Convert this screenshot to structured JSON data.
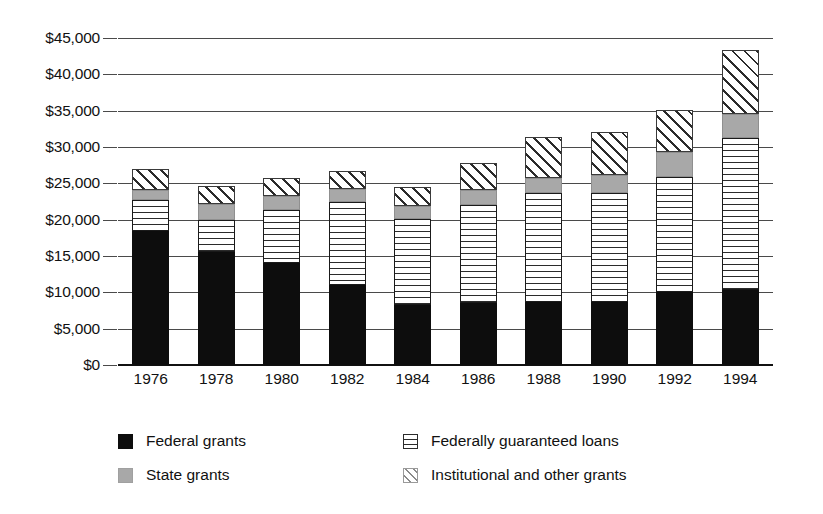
{
  "chart_data": {
    "type": "bar",
    "stacked": true,
    "title": "",
    "subtitle": "",
    "xlabel": "",
    "ylabel": "",
    "grid": true,
    "legend_position": "bottom",
    "ylim": [
      0,
      45000
    ],
    "ytick_step": 5000,
    "ytick_labels": [
      "$0",
      "$5,000",
      "$10,000",
      "$15,000",
      "$20,000",
      "$25,000",
      "$30,000",
      "$35,000",
      "$40,000",
      "$45,000"
    ],
    "ytick_values": [
      0,
      5000,
      10000,
      15000,
      20000,
      25000,
      30000,
      35000,
      40000,
      45000
    ],
    "categories": [
      "1976",
      "1978",
      "1980",
      "1982",
      "1984",
      "1986",
      "1988",
      "1990",
      "1992",
      "1994"
    ],
    "series": [
      {
        "name": "Federal grants",
        "pattern": "solid-black",
        "color": "#0d0d0d",
        "values": [
          18400,
          15500,
          14000,
          11000,
          8300,
          8500,
          8700,
          8700,
          10100,
          10300
        ]
      },
      {
        "name": "Federally guaranteed loans",
        "pattern": "horizontal-lines",
        "color": "#2b2b2b",
        "values": [
          4300,
          4400,
          7300,
          11400,
          11800,
          13500,
          15000,
          15000,
          15800,
          21000
        ]
      },
      {
        "name": "State grants",
        "pattern": "solid-gray",
        "color": "#a8a8a8",
        "values": [
          1400,
          2300,
          1900,
          1800,
          1800,
          2100,
          2100,
          2500,
          3400,
          3300
        ]
      },
      {
        "name": "Institutional and other grants",
        "pattern": "diagonal-hatch",
        "color": "#3a3a3a",
        "values": [
          2900,
          2500,
          2500,
          2500,
          2600,
          3700,
          5600,
          5800,
          5800,
          8700
        ]
      }
    ],
    "totals": [
      27000,
      24700,
      25700,
      26700,
      24500,
      27800,
      31400,
      32000,
      35100,
      43300
    ]
  },
  "legend": {
    "items": [
      {
        "label": "Federal grants",
        "swatch": "solid-black-swatch"
      },
      {
        "label": "State grants",
        "swatch": "solid-gray-swatch"
      },
      {
        "label": "Federally guaranteed loans",
        "swatch": "horizontal-lines-swatch"
      },
      {
        "label": "Institutional and other grants",
        "swatch": "diagonal-hatch-swatch"
      }
    ]
  }
}
